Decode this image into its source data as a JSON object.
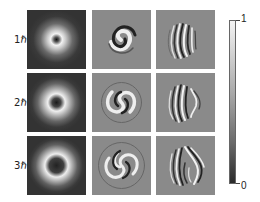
{
  "figure": {
    "rows": [
      {
        "label": "1",
        "unit": "ℏ"
      },
      {
        "label": "2",
        "unit": "ℏ"
      },
      {
        "label": "3",
        "unit": "ℏ"
      }
    ],
    "columns": [
      "intensity",
      "spiral-interference",
      "fringe-interference"
    ],
    "colorbar": {
      "max_label": "1",
      "min_label": "0",
      "colormap": "grayscale"
    }
  }
}
